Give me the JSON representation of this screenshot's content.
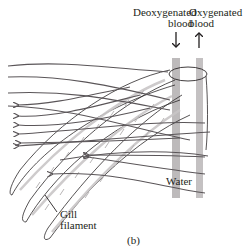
{
  "figure": {
    "caption": "(b)",
    "labels": {
      "deoxygenated_line1": "Deoxygenated",
      "deoxygenated_line2": "blood",
      "oxygenated_line1": "Oxygenated",
      "oxygenated_line2": "blood",
      "water": "Water",
      "gill_line1": "Gill",
      "gill_line2": "filament"
    },
    "colors": {
      "water_lines": "#5a5558",
      "filament_outline": "#2b2728",
      "vessel": "#b9b6b7",
      "lamellae": "#c9c6c7",
      "text": "#231f20"
    }
  }
}
